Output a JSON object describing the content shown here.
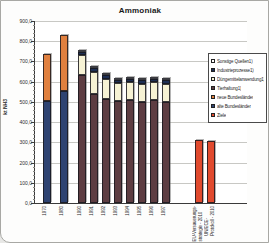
{
  "chart_data": {
    "type": "bar",
    "stacked": true,
    "title": "Ammoniak",
    "ylabel": "kt NH3",
    "ylim": [
      0,
      900
    ],
    "ytick_step": 100,
    "ytick_minor": 20,
    "grid": true,
    "legend_position": "right",
    "yticks": [
      "0,0",
      "100,0",
      "200,0",
      "300,0",
      "400,0",
      "500,0",
      "600,0",
      "700,0",
      "800,0",
      "900,0"
    ],
    "categories": [
      "1970",
      "1980",
      "1990",
      "1991",
      "1992",
      "1993",
      "1994",
      "1995",
      "1996",
      "1997",
      "EU-Versauerungs-\nstrategie - 2010",
      "UN/ECE-\nProtokoll - 2010"
    ],
    "series": [
      {
        "name": "alte Bundesländer",
        "color": "#2e4372",
        "values": [
          505,
          555,
          0,
          0,
          0,
          0,
          0,
          0,
          0,
          0,
          0,
          0
        ]
      },
      {
        "name": "neue Bundesländer",
        "color": "#e0803f",
        "values": [
          230,
          275,
          0,
          0,
          0,
          0,
          0,
          0,
          0,
          0,
          0,
          0
        ]
      },
      {
        "name": "Tierhaltung1)",
        "color": "#5d3d42",
        "values": [
          0,
          0,
          637,
          538,
          513,
          505,
          508,
          500,
          508,
          502,
          0,
          0
        ]
      },
      {
        "name": "Düngemittelanwendung1)",
        "color": "#f6f2d4",
        "values": [
          0,
          0,
          95,
          110,
          100,
          88,
          89,
          90,
          89,
          88,
          0,
          0
        ]
      },
      {
        "name": "Industrieprozesse1)",
        "color": "#1e2f55",
        "values": [
          0,
          0,
          16,
          20,
          19,
          18,
          18,
          18,
          18,
          18,
          0,
          0
        ]
      },
      {
        "name": "Sonstige Quellen1)",
        "color": "#ffffff",
        "values": [
          0,
          0,
          8,
          10,
          10,
          9,
          9,
          9,
          9,
          9,
          0,
          0
        ]
      },
      {
        "name": "Ziele",
        "color": "#e14a2e",
        "values": [
          0,
          0,
          0,
          0,
          0,
          0,
          0,
          0,
          0,
          0,
          310,
          305
        ]
      }
    ],
    "legend_order": [
      "Sonstige Quellen1)",
      "Industrieprozesse1)",
      "Düngemittelanwendung1)",
      "Tierhaltung1)",
      "neue Bundesländer",
      "alte Bundesländer",
      "Ziele"
    ],
    "layout": {
      "plot_left": 33,
      "plot_top": 20,
      "plot_w": 212,
      "plot_h": 182,
      "bar_width": 8,
      "bar_x": [
        7.5,
        24.5,
        42.5,
        55,
        67,
        79,
        91,
        103,
        115,
        127,
        160,
        172
      ]
    }
  }
}
